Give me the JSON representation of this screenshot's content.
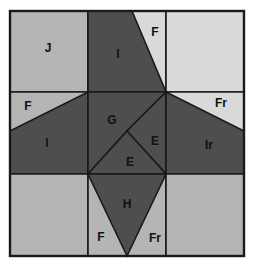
{
  "figure": {
    "title": "",
    "type": "geometric-dissection-diagram",
    "canvas": {
      "width": 254,
      "height": 269
    },
    "frame": {
      "x": 10,
      "y": 11,
      "width": 234,
      "height": 245
    },
    "grid": {
      "columns": 3,
      "rows": 3,
      "vertical_lines_x": [
        88,
        166
      ],
      "horizontal_lines_y": [
        92,
        174
      ]
    },
    "colors": {
      "background": "#ffffff",
      "light_gray": "#b5b5b5",
      "pale_gray": "#d9d9d9",
      "dark_gray": "#4e4e4e",
      "outline": "#1a1a1a",
      "label_text": "#111111"
    },
    "pieces": [
      {
        "id": "p-J",
        "label": "J",
        "shade": "light",
        "label_x": 48,
        "label_y": 49
      },
      {
        "id": "p-I-top",
        "label": "I",
        "shade": "dark",
        "label_x": 118,
        "label_y": 55
      },
      {
        "id": "p-F-top",
        "label": "F",
        "shade": "pale",
        "label_x": 155,
        "label_y": 33
      },
      {
        "id": "p-topright",
        "label": "",
        "shade": "pale",
        "label_x": 205,
        "label_y": 50
      },
      {
        "id": "p-F-left",
        "label": "F",
        "shade": "light",
        "label_x": 28,
        "label_y": 107
      },
      {
        "id": "p-I-left",
        "label": "I",
        "shade": "dark",
        "label_x": 47,
        "label_y": 144
      },
      {
        "id": "p-G",
        "label": "G",
        "shade": "dark",
        "label_x": 112,
        "label_y": 121
      },
      {
        "id": "p-E-right",
        "label": "E",
        "shade": "dark",
        "label_x": 155,
        "label_y": 142
      },
      {
        "id": "p-E-lower",
        "label": "E",
        "shade": "dark",
        "label_x": 130,
        "label_y": 163
      },
      {
        "id": "p-Fr-right",
        "label": "Fr",
        "shade": "pale",
        "label_x": 221,
        "label_y": 104
      },
      {
        "id": "p-Ir",
        "label": "Ir",
        "shade": "dark",
        "label_x": 209,
        "label_y": 146
      },
      {
        "id": "p-bottomleft",
        "label": "",
        "shade": "light",
        "label_x": 48,
        "label_y": 215
      },
      {
        "id": "p-F-bottom",
        "label": "F",
        "shade": "light",
        "label_x": 101,
        "label_y": 238
      },
      {
        "id": "p-H",
        "label": "H",
        "shade": "dark",
        "label_x": 127,
        "label_y": 205
      },
      {
        "id": "p-Fr-bottom",
        "label": "Fr",
        "shade": "light",
        "label_x": 155,
        "label_y": 239
      },
      {
        "id": "p-bottomright",
        "label": "",
        "shade": "light",
        "label_x": 205,
        "label_y": 215
      }
    ],
    "labels_visible": [
      "J",
      "I",
      "F",
      "F",
      "I",
      "G",
      "E",
      "E",
      "Fr",
      "Ir",
      "H",
      "F",
      "Fr"
    ]
  }
}
